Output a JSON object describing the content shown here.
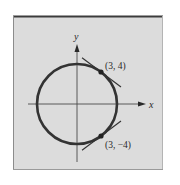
{
  "figure": {
    "type": "circle-with-tangent-lines",
    "axes": {
      "x_label": "x",
      "y_label": "y"
    },
    "circle": {
      "equation_implied": "x^2 + y^2 = 25",
      "center": [
        0,
        0
      ],
      "radius": 5
    },
    "points": [
      {
        "label": "(3, 4)",
        "x": 3,
        "y": 4
      },
      {
        "label": "(3, −4)",
        "x": 3,
        "y": -4
      }
    ],
    "tangent_lines": [
      {
        "at": "(3, 4)",
        "slope": -0.75
      },
      {
        "at": "(3, −4)",
        "slope": 0.75
      }
    ],
    "colors": {
      "panel_background": "#dcdcdc",
      "page_background": "#ffffff",
      "curve": "#333333",
      "axes": "#4a4a4a",
      "frame_top": "#3c3c3c",
      "frame_side": "#8c8c8c"
    }
  }
}
